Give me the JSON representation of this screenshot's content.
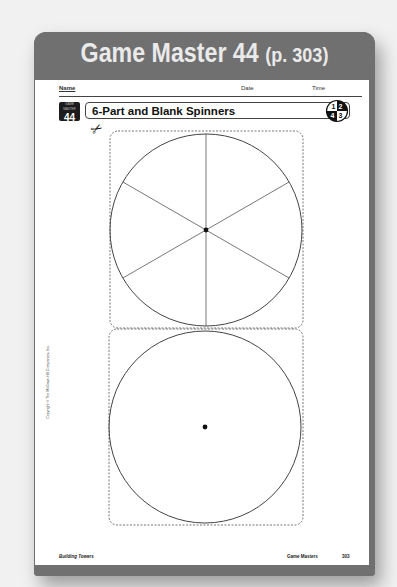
{
  "header": {
    "title": "Game Master 44",
    "page_ref": "(p. 303)"
  },
  "worksheet": {
    "name_label": "Name",
    "date_label": "Date",
    "time_label": "Time",
    "badge_small": "GAME MASTER",
    "badge_number": "44",
    "title": "6-Part and Blank Spinners",
    "grade_icon_digits": [
      "1",
      "2",
      "3",
      "4"
    ],
    "scissors_icon": "scissors-icon",
    "spinners": [
      {
        "name": "6-part spinner",
        "sections": 6,
        "has_center_dot": true
      },
      {
        "name": "blank spinner",
        "sections": 0,
        "has_center_dot": true
      }
    ],
    "copyright": "Copyright © The McGraw-Hill Companies, Inc.",
    "footer_left": "Building Towers",
    "footer_right": "Game Masters",
    "footer_page": "303"
  },
  "colors": {
    "frame": "#707070",
    "title_text": "#eaeaea",
    "page": "#ffffff",
    "ink": "#222222"
  }
}
